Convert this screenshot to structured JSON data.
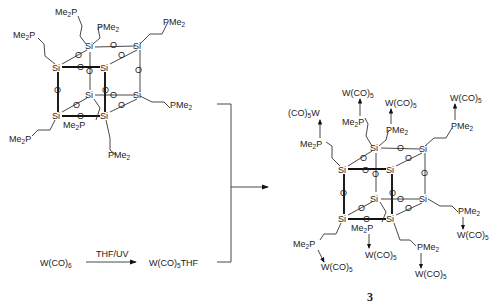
{
  "scheme": {
    "reactant_cage": {
      "core_atom": "Si",
      "bridge_atom": "O",
      "substituent": "PMe2",
      "substituent_left": "Me2P",
      "substituent_count": 8
    },
    "reagent": {
      "start": "W(CO)6",
      "condition": "THF/UV",
      "intermediate": "W(CO)5THF"
    },
    "product": {
      "label": "3",
      "ligand": "W(CO)5",
      "ligand_left": "(CO)5W"
    }
  }
}
